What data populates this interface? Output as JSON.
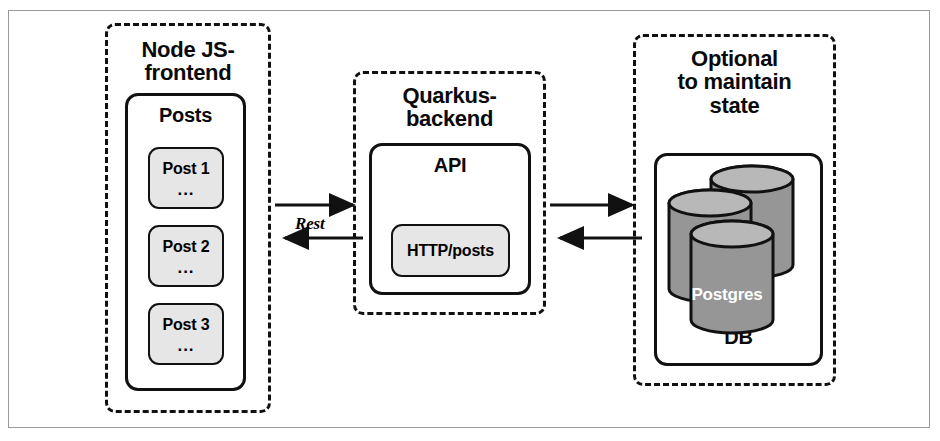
{
  "diagram": {
    "frontend_panel": {
      "title_line1": "Node JS-",
      "title_line2": "frontend",
      "container_title": "Posts",
      "posts": [
        {
          "label": "Post 1",
          "dots": "..."
        },
        {
          "label": "Post 2",
          "dots": "..."
        },
        {
          "label": "Post 3",
          "dots": "..."
        }
      ]
    },
    "backend_panel": {
      "title_line1": "Quarkus-",
      "title_line2": "backend",
      "container_title": "API",
      "endpoint": "HTTP/posts"
    },
    "database_panel": {
      "title_line1": "Optional",
      "title_line2": "to maintain",
      "title_line3": "state",
      "container_title": "DB",
      "cylinder_label": "Postgres"
    },
    "connections": [
      {
        "from": "frontend",
        "to": "backend",
        "direction": "right",
        "label": "Rest"
      },
      {
        "from": "backend",
        "to": "frontend",
        "direction": "left",
        "label": ""
      },
      {
        "from": "backend",
        "to": "database",
        "direction": "right",
        "label": ""
      },
      {
        "from": "database",
        "to": "backend",
        "direction": "left",
        "label": ""
      }
    ],
    "colors": {
      "stroke": "#111111",
      "leaf_fill": "#e6e6e6",
      "cylinder_body": "#969696",
      "cylinder_top": "#b8b8b8",
      "frame_border": "#9a9a9a",
      "background": "#ffffff"
    }
  }
}
